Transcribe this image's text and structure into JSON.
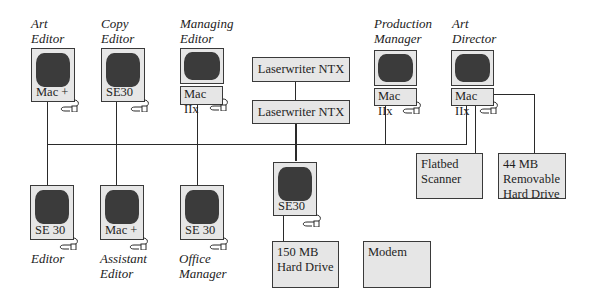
{
  "diagram": {
    "title_roles_top": [
      {
        "id": "art-editor",
        "role_line1": "Art",
        "role_line2": "Editor",
        "model": "Mac +"
      },
      {
        "id": "copy-editor",
        "role_line1": "Copy",
        "role_line2": "Editor",
        "model": "SE30"
      },
      {
        "id": "managing-editor",
        "role_line1": "Managing",
        "role_line2": "Editor",
        "model": "Mac IIx"
      },
      {
        "id": "production-manager",
        "role_line1": "Production",
        "role_line2": "Manager",
        "model": "Mac IIx"
      },
      {
        "id": "art-director",
        "role_line1": "Art",
        "role_line2": "Director",
        "model": "Mac IIx"
      }
    ],
    "roles_bottom": [
      {
        "id": "editor",
        "role_line1": "Editor",
        "role_line2": "",
        "model": "SE 30"
      },
      {
        "id": "assistant-editor",
        "role_line1": "Assistant",
        "role_line2": "Editor",
        "model": "Mac +"
      },
      {
        "id": "office-manager",
        "role_line1": "Office",
        "role_line2": "Manager",
        "model": "SE 30"
      }
    ],
    "center_workstation": {
      "model": "SE30"
    },
    "printers": [
      {
        "label": "Laserwriter NTX"
      },
      {
        "label": "Laserwriter NTX"
      }
    ],
    "peripherals": {
      "scanner": {
        "line1": "Flatbed",
        "line2": "Scanner"
      },
      "removable_drive": {
        "line1": "44 MB",
        "line2": "Removable",
        "line3": "Hard Drive"
      },
      "hard_drive": {
        "line1": "150 MB",
        "line2": "Hard Drive"
      },
      "modem": {
        "line1": "Modem"
      }
    },
    "colors": {
      "line": "#2a2a2a",
      "box_fill": "#e6e6e6",
      "screen": "#3b3b3b",
      "background": "#ffffff"
    }
  }
}
